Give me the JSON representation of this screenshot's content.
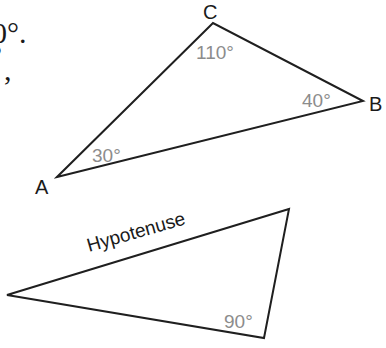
{
  "fragments": {
    "line1": "0°.",
    "line2": "°",
    "line3": ","
  },
  "triangle_abc": {
    "vertices": {
      "A": {
        "label": "A",
        "x": 57,
        "y": 177
      },
      "B": {
        "label": "B",
        "x": 363,
        "y": 101
      },
      "C": {
        "label": "C",
        "x": 213,
        "y": 23
      }
    },
    "angles": {
      "A": "30°",
      "B": "40°",
      "C": "110°"
    }
  },
  "right_triangle": {
    "side_label": "Hypotenuse",
    "right_angle": "90°",
    "vertices": [
      {
        "x": 7,
        "y": 295
      },
      {
        "x": 289,
        "y": 209
      },
      {
        "x": 264,
        "y": 338
      }
    ]
  },
  "colors": {
    "stroke": "#1f1f1f",
    "angle_text": "#8c8c8c",
    "label_text": "#1a1a1a"
  }
}
